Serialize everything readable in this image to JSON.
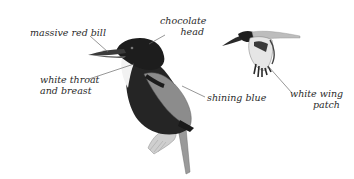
{
  "illustration": {
    "subject": "kingfisher (perched and in flight)",
    "colors": {
      "background": "#ffffff",
      "label_text": "#2a2a2a",
      "leader_line": "#6a6a6a",
      "head": "#1e1e1e",
      "body_dark": "#262626",
      "wing_blue": "#8a8a8a",
      "throat": "#f4f4f4",
      "perch": "#c8c8c8"
    }
  },
  "labels": {
    "bill": {
      "line1": "massive red bill"
    },
    "head": {
      "line1": "chocolate",
      "line2": "head"
    },
    "throat": {
      "line1": "white throat",
      "line2": "and breast"
    },
    "blue": {
      "line1": "shining blue"
    },
    "wing_patch": {
      "line1": "white wing",
      "line2": "patch"
    }
  }
}
